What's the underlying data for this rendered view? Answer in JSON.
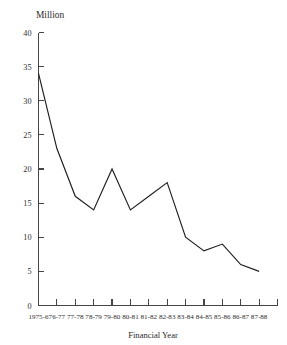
{
  "chart_data": {
    "type": "line",
    "title": "Million",
    "subtitle": "",
    "xlabel": "Financial Year",
    "ylabel": "Million",
    "categories": [
      "1975-6",
      "76-77",
      "77-78",
      "78-79",
      "79-80",
      "80-81",
      "81-82",
      "82-83",
      "83-84",
      "84-85",
      "85-86",
      "86-87",
      "87-88"
    ],
    "values": [
      34,
      23,
      16,
      14,
      20,
      14,
      16,
      18,
      10,
      8,
      9,
      6,
      5
    ],
    "series": [
      {
        "name": "Million",
        "values": [
          34,
          23,
          16,
          14,
          20,
          14,
          16,
          18,
          10,
          8,
          9,
          6,
          5
        ]
      }
    ],
    "ylim": [
      0,
      40
    ],
    "ytick_values": [
      0,
      5,
      10,
      15,
      20,
      25,
      30,
      35,
      40
    ],
    "ytick_labels": [
      "0",
      "5",
      "10",
      "15",
      "20",
      "25",
      "30",
      "35",
      "40"
    ],
    "grid": false,
    "legend": false,
    "legend_position": "none",
    "line_color": "#1e1e1e",
    "axis_color": "#454545"
  },
  "axes": {
    "unit_label": "Million",
    "x_axis_title": "Financial Year"
  }
}
